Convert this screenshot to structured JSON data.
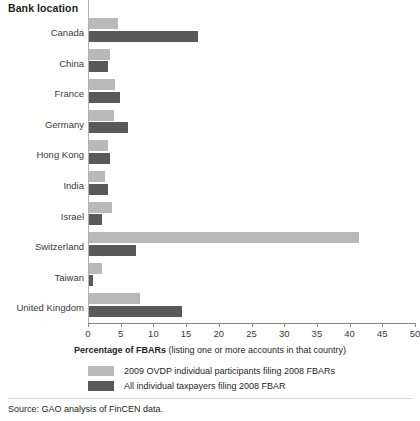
{
  "chart_data": {
    "type": "bar",
    "orientation": "horizontal",
    "title": "Bank location",
    "xlabel_bold": "Percentage of FBARs",
    "xlabel_rest": " (listing one or more accounts in that country)",
    "ylabel": "Bank location",
    "xlim": [
      0,
      50
    ],
    "xticks": [
      0,
      5,
      10,
      15,
      20,
      25,
      30,
      35,
      40,
      45,
      50
    ],
    "grid": false,
    "legend_position": "bottom-left",
    "categories": [
      "Canada",
      "China",
      "France",
      "Germany",
      "Hong Kong",
      "India",
      "Israel",
      "Switzerland",
      "Taiwan",
      "United Kingdom"
    ],
    "series": [
      {
        "name": "2009 OVDP individual participants filing 2008 FBARs",
        "color": "#b9b9b9",
        "values": [
          4.6,
          3.4,
          4.1,
          4.0,
          3.0,
          2.6,
          3.6,
          41.5,
          2.1,
          8.0
        ]
      },
      {
        "name": "All individual taxpayers filing 2008 FBAR",
        "color": "#595959",
        "values": [
          16.8,
          3.1,
          4.9,
          6.1,
          3.3,
          3.1,
          2.1,
          7.3,
          0.8,
          14.4
        ]
      }
    ],
    "source": "Source: GAO analysis of FinCEN data."
  },
  "legend": {
    "items": [
      {
        "label": "2009 OVDP individual participants filing 2008 FBARs",
        "swatch": "light"
      },
      {
        "label": "All individual taxpayers filing 2008 FBAR",
        "swatch": "dark"
      }
    ]
  }
}
